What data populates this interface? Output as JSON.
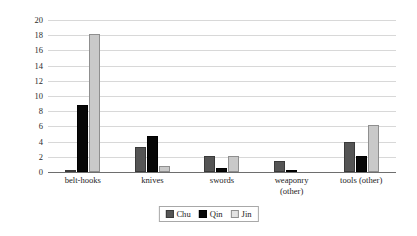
{
  "chart_data": {
    "type": "bar",
    "title": "",
    "xlabel": "",
    "ylabel": "Percentage",
    "ylim": [
      0,
      20
    ],
    "ytick_step": 2,
    "yticks": [
      20,
      18,
      16,
      14,
      12,
      10,
      8,
      6,
      4,
      2,
      0
    ],
    "grid": true,
    "legend_position": "bottom-center",
    "categories": [
      "belt-hooks",
      "knives",
      "swords",
      "weaponry (other)",
      "tools (other)"
    ],
    "category_lines": [
      [
        "belt-hooks",
        ""
      ],
      [
        "knives",
        ""
      ],
      [
        "swords",
        ""
      ],
      [
        "weaponry",
        "(other)"
      ],
      [
        "tools (other)",
        ""
      ]
    ],
    "series": [
      {
        "name": "Chu",
        "color": "#555555",
        "values": [
          0.2,
          3.3,
          2.1,
          1.45,
          4.0
        ]
      },
      {
        "name": "Qin",
        "color": "#070707",
        "values": [
          8.8,
          4.75,
          0.55,
          0.15,
          2.1
        ]
      },
      {
        "name": "Jin",
        "color": "#c9c9c9",
        "values": [
          18.2,
          0.85,
          2.15,
          0,
          6.2
        ]
      }
    ]
  },
  "legend": {
    "items": [
      {
        "label": "Chu"
      },
      {
        "label": "Qin"
      },
      {
        "label": "Jin"
      }
    ]
  },
  "colors": {
    "chu": "#555555",
    "qin": "#070707",
    "jin": "#c9c9c9",
    "gridline": "#d8d8d8",
    "axis": "#6e6e6e",
    "background": "#ffffff"
  }
}
